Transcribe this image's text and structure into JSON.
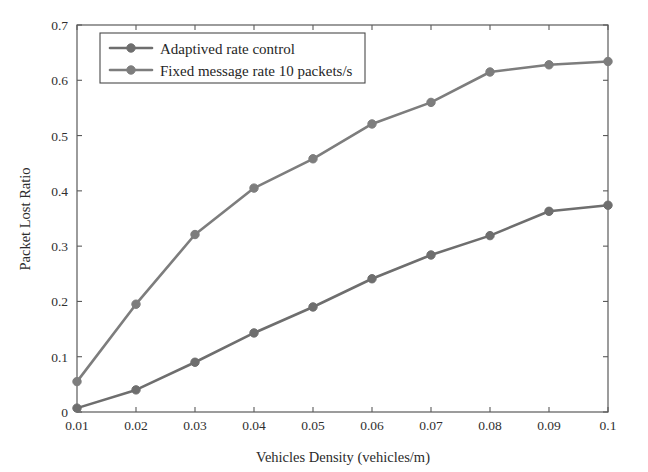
{
  "chart_data": {
    "type": "line",
    "title": "",
    "xlabel": "Vehicles Density (vehicles/m)",
    "ylabel": "Packet Lost Ratio",
    "x": [
      0.01,
      0.02,
      0.03,
      0.04,
      0.05,
      0.06,
      0.07,
      0.08,
      0.09,
      0.1
    ],
    "xticklabels": [
      "0.01",
      "0.02",
      "0.03",
      "0.04",
      "0.05",
      "0.06",
      "0.07",
      "0.08",
      "0.09",
      "0.1"
    ],
    "yticklabels": [
      "0",
      "0.1",
      "0.2",
      "0.3",
      "0.4",
      "0.5",
      "0.6",
      "0.7"
    ],
    "yticks": [
      0,
      0.1,
      0.2,
      0.3,
      0.4,
      0.5,
      0.6,
      0.7
    ],
    "xlim": [
      0.01,
      0.1
    ],
    "ylim": [
      0,
      0.7
    ],
    "grid": false,
    "legend_position": "upper left",
    "series": [
      {
        "name": "Adaptived rate control",
        "color": "#6e6e6e",
        "marker": "circle",
        "values": [
          0.007,
          0.04,
          0.09,
          0.143,
          0.19,
          0.241,
          0.284,
          0.319,
          0.363,
          0.374
        ]
      },
      {
        "name": "Fixed message rate 10 packets/s",
        "color": "#7d7d7d",
        "marker": "circle",
        "values": [
          0.055,
          0.195,
          0.321,
          0.405,
          0.458,
          0.521,
          0.56,
          0.615,
          0.628,
          0.634
        ]
      }
    ]
  },
  "legend": {
    "entries": [
      {
        "label": "Adaptived rate control"
      },
      {
        "label": "Fixed message rate 10 packets/s"
      }
    ]
  },
  "axes": {
    "x_title": "Vehicles Density (vehicles/m)",
    "y_title": "Packet Lost Ratio"
  },
  "colors": {
    "series_1": "#6e6e6e",
    "series_2": "#7d7d7d",
    "axis": "#5a5a5a",
    "background": "#ffffff"
  }
}
